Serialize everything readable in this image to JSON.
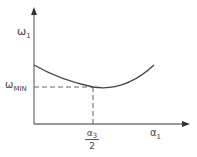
{
  "diagram": {
    "y_axis_label": {
      "symbol": "ω",
      "subscript": "1"
    },
    "x_axis_label": {
      "symbol": "α",
      "subscript": "1"
    },
    "min_label": {
      "symbol": "ω",
      "subscript": "MIN"
    },
    "x_marker": {
      "numerator_symbol": "α",
      "numerator_subscript": "3",
      "denominator": "2"
    },
    "curve": "convex curve (U-shape) with minimum at α1 = α3/2, ω1 = ωMIN",
    "colors": {
      "line": "#555555",
      "text": "#444444",
      "background": "#ffffff"
    }
  }
}
